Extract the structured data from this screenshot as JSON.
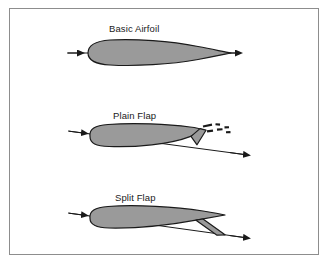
{
  "figure": {
    "background_color": "#ffffff",
    "border_color": "#8d8d8d",
    "body_fill": "#9a9a9a",
    "outline_color": "#1a1a1a",
    "label_color": "#1a1a1a",
    "caption_fragment": ""
  },
  "panels": [
    {
      "id": "basic-airfoil",
      "label": "Basic Airfoil",
      "description": "Symmetric teardrop airfoil section with horizontal chord line and double-headed arrow",
      "chord_line": "horizontal",
      "flap_deflected": false,
      "has_dashed_reference": false
    },
    {
      "id": "plain-flap",
      "label": "Plain Flap",
      "description": "Airfoil with entire trailing edge section hinged downward; dashed marks show undeflected flap position",
      "chord_line": "inclined",
      "flap_deflected": true,
      "has_dashed_reference": true
    },
    {
      "id": "split-flap",
      "label": "Split Flap",
      "description": "Airfoil with lower trailing edge surface deflected downward while upper surface remains fixed",
      "chord_line": "inclined",
      "flap_deflected": true,
      "has_dashed_reference": false
    }
  ],
  "arrows": {
    "leading_edge_direction": "left",
    "trailing_edge_direction": "right"
  }
}
